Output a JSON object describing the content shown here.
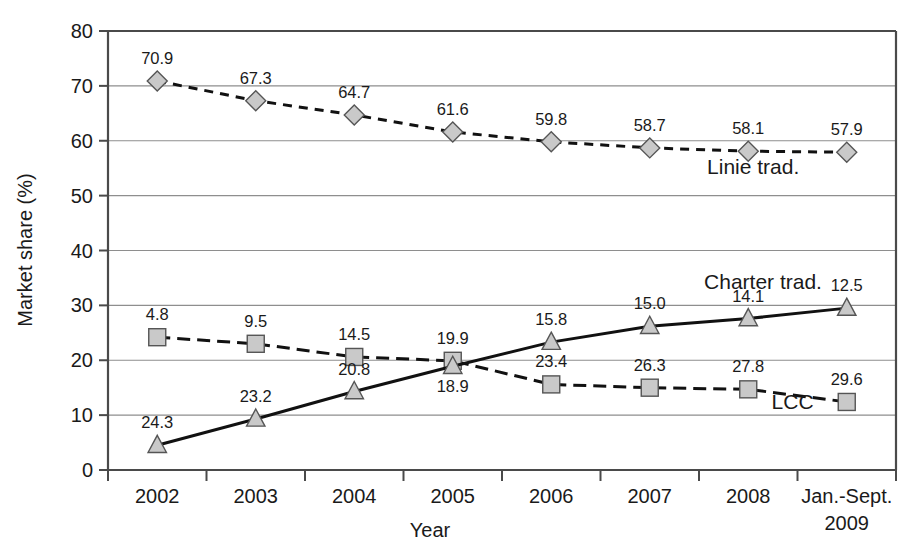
{
  "chart_data": {
    "type": "line",
    "title": "",
    "xlabel": "Year",
    "ylabel": "Market share (%)",
    "ylim": [
      0,
      80
    ],
    "yticks": [
      0,
      10,
      20,
      30,
      40,
      50,
      60,
      70,
      80
    ],
    "ytick_labels": [
      "0",
      "10",
      "20",
      "30",
      "40",
      "50",
      "60",
      "70",
      "80"
    ],
    "grid": "horizontal",
    "legend_position": "inline-annotations",
    "categories": [
      "2002",
      "2003",
      "2004",
      "2005",
      "2006",
      "2007",
      "2008",
      "Jan.-Sept. 2009"
    ],
    "xtick_labels": [
      "2002",
      "2003",
      "2004",
      "2005",
      "2006",
      "2007",
      "2008",
      "Jan.-Sept."
    ],
    "xtick_label_second_line": [
      "",
      "",
      "",
      "",
      "",
      "",
      "",
      "2009"
    ],
    "series": [
      {
        "name": "Linie trad.",
        "marker": "diamond",
        "line_style": "dashed",
        "annotation_label": "Linie trad.",
        "values": [
          70.9,
          67.3,
          64.7,
          61.6,
          59.8,
          58.7,
          58.1,
          57.9
        ],
        "point_labels": [
          "70.9",
          "67.3",
          "64.7",
          "61.6",
          "59.8",
          "58.7",
          "58.1",
          "57.9"
        ],
        "label_position": "above",
        "connected_through": 7,
        "last_point_detached": true
      },
      {
        "name": "Charter trad.",
        "marker": "square",
        "line_style": "dash-dot",
        "annotation_label": "LCC",
        "values": [
          24.2,
          23.0,
          20.6,
          19.9,
          15.6,
          15.0,
          14.7,
          12.4
        ],
        "point_labels": [
          "4.8",
          "9.5",
          "14.5",
          "19.9",
          "23.4",
          "26.3",
          "27.8",
          "29.6"
        ],
        "label_position": "above",
        "connected_through": 7,
        "last_point_detached": true
      },
      {
        "name": "LCC",
        "marker": "triangle",
        "line_style": "solid",
        "annotation_label": "Charter trad.",
        "values": [
          4.5,
          9.3,
          14.3,
          18.9,
          23.3,
          26.2,
          27.6,
          29.5
        ],
        "point_labels": [
          "24.3",
          "23.2",
          "20.8",
          "18.9",
          "15.8",
          "15.0",
          "14.1",
          "12.5"
        ],
        "label_position": "above",
        "label_position_overrides": {
          "3": "below"
        },
        "connected_through": 7,
        "last_point_detached": true
      }
    ],
    "annotations": [
      {
        "text": "Linie trad.",
        "x_value": 6.05,
        "y_value": 54.0
      },
      {
        "text": "Charter trad.",
        "x_value": 6.15,
        "y_value": 33.0
      },
      {
        "text": "LCC",
        "x_value": 6.45,
        "y_value": 11.2
      }
    ],
    "colors": {
      "marker_fill": "#c9c9c9",
      "marker_stroke": "#555555",
      "line": "#111111",
      "axis": "#4a4a4a",
      "grid": "#8e8e8e",
      "text": "#1a1a1a",
      "background": "#ffffff"
    }
  }
}
